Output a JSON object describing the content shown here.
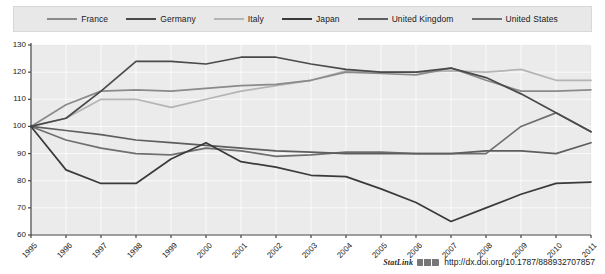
{
  "chart_data": {
    "type": "line",
    "title": "",
    "subtitle": "",
    "xlabel": "",
    "ylabel": "",
    "grid": true,
    "legend_position": "top",
    "ylim": [
      60,
      130
    ],
    "yticks": [
      60,
      70,
      80,
      90,
      100,
      110,
      120,
      130
    ],
    "x": [
      "1995",
      "1996",
      "1997",
      "1998",
      "1999",
      "2000",
      "2001",
      "2002",
      "2003",
      "2004",
      "2005",
      "2006",
      "2007",
      "2008",
      "2009",
      "2010",
      "2011"
    ],
    "series": [
      {
        "name": "France",
        "color": "#8a8a8a",
        "values": [
          100,
          108,
          113,
          113.5,
          113,
          114,
          115,
          115.5,
          117,
          120,
          119.5,
          119,
          121.5,
          117,
          113,
          113,
          113.5
        ]
      },
      {
        "name": "Germany",
        "color": "#4a4a4a",
        "values": [
          100,
          103,
          113,
          124,
          124,
          123,
          125.5,
          125.5,
          123,
          121,
          120,
          120,
          121.5,
          118,
          112,
          105,
          98
        ]
      },
      {
        "name": "Italy",
        "color": "#b4b4b4",
        "values": [
          100,
          103,
          110,
          110,
          107,
          110,
          113,
          115,
          117,
          120.5,
          120,
          120,
          120.5,
          120,
          121,
          117,
          117
        ]
      },
      {
        "name": "Japan",
        "color": "#3a3a3a",
        "values": [
          100,
          84,
          79,
          79,
          88,
          94,
          87,
          85,
          82,
          81.5,
          77,
          72,
          65,
          70,
          75,
          79,
          79.5
        ]
      },
      {
        "name": "United Kingdom",
        "color": "#5e5e5e",
        "values": [
          100,
          98.5,
          97,
          95,
          94,
          93,
          92,
          91,
          90.5,
          90,
          90,
          90,
          90,
          91,
          91,
          90,
          94
        ]
      },
      {
        "name": "United States",
        "color": "#6f6f6f",
        "values": [
          100,
          95,
          92,
          90,
          89.5,
          92,
          91,
          89,
          89.5,
          90.5,
          90.5,
          90,
          90,
          90,
          100,
          105,
          98
        ]
      }
    ]
  },
  "legend": {
    "items": [
      {
        "label": "France"
      },
      {
        "label": "Germany"
      },
      {
        "label": "Italy"
      },
      {
        "label": "Japan"
      },
      {
        "label": "United Kingdom"
      },
      {
        "label": "United States"
      }
    ]
  },
  "footer": {
    "statlink_label": "StatLink",
    "url": "http://dx.doi.org/10.1787/888932707857"
  }
}
